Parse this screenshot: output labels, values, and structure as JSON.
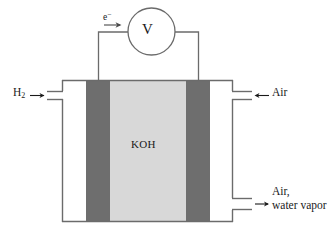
{
  "diagram": {
    "labels": {
      "fuel_inlet": "H",
      "fuel_inlet_sub": "2",
      "electron": "e",
      "electron_sup": "−",
      "meter": "V",
      "electrolyte": "KOH",
      "oxidant_inlet": "Air",
      "exhaust_line1": "Air,",
      "exhaust_line2": "water vapor"
    },
    "icons": {
      "fuel_arrow": "arrow-right-icon",
      "electron_arrow": "arrow-right-icon",
      "oxidant_arrow": "arrow-left-icon",
      "exhaust_arrow": "arrow-right-icon",
      "voltmeter": "voltmeter-circle-icon"
    },
    "colors": {
      "electrode": "#6e6e6e",
      "electrolyte": "#d8d8d8",
      "gas_chamber": "#ffffff",
      "outline": "#6b6b6b",
      "wire": "#6b6b6b",
      "text": "#1a1a1a"
    },
    "geometry": {
      "cell_left": 62,
      "cell_right": 233,
      "cell_top": 80,
      "cell_bottom": 222,
      "anode_x": [
        86,
        110
      ],
      "electrolyte_x": [
        110,
        186
      ],
      "cathode_x": [
        186,
        210
      ]
    }
  }
}
